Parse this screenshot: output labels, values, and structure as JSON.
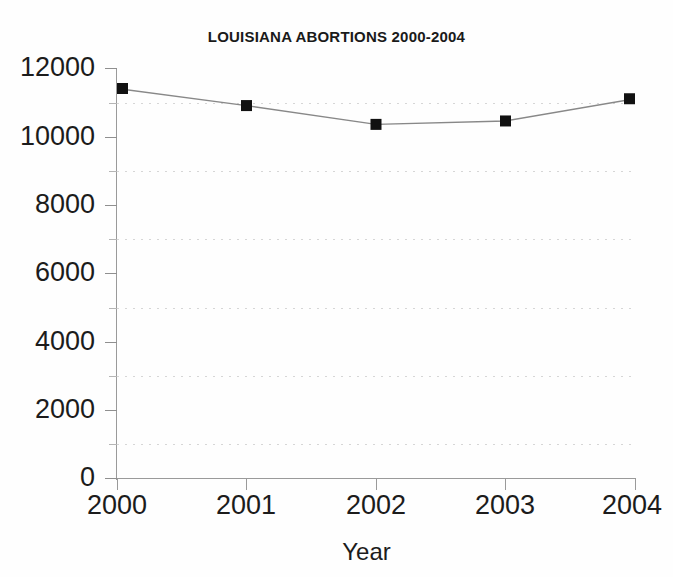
{
  "chart_data": {
    "type": "line",
    "title": "LOUISIANA ABORTIONS 2000-2004",
    "xlabel": "Year",
    "ylabel": "",
    "categories": [
      "2000",
      "2001",
      "2002",
      "2003",
      "2004"
    ],
    "x": [
      2000,
      2001,
      2002,
      2003,
      2004
    ],
    "values": [
      11400,
      10900,
      10350,
      10450,
      11100
    ],
    "series": [
      {
        "name": "Louisiana abortions",
        "values": [
          11400,
          10900,
          10350,
          10450,
          11100
        ],
        "marker": "filled-square",
        "marker_color": "#111111",
        "line_color": "#888888"
      }
    ],
    "ylim": [
      0,
      12000
    ],
    "y_ticks": [
      0,
      2000,
      4000,
      6000,
      8000,
      10000,
      12000
    ],
    "y_tick_labels": [
      "0",
      "2000",
      "4000",
      "6000",
      "8000",
      "10000",
      "12000"
    ],
    "y_minor_ticks": [
      1000,
      3000,
      5000,
      7000,
      9000,
      11000
    ],
    "gridlines": [
      1000,
      3000,
      5000,
      7000,
      9000,
      11000
    ],
    "grid": "dotted-horizontal-minor",
    "legend": "none",
    "legend_position": "none",
    "xlim": [
      2000,
      2004
    ],
    "colors": {
      "marker": "#111111",
      "line": "#8a8a8a",
      "grid": "#cfcfcf",
      "axis": "#9a9a9a",
      "text": "#1c1c1c",
      "background": "#fefefe"
    }
  }
}
